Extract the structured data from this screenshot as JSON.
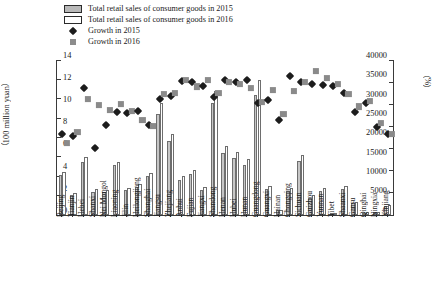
{
  "legend": {
    "items": [
      {
        "key": "bar-filled",
        "label": "Total retail sales of consumer goods in 2015"
      },
      {
        "key": "bar-hollow",
        "label": "Total retail sales of consumer goods in 2016"
      },
      {
        "key": "diamond-black",
        "label": "Growth in 2015"
      },
      {
        "key": "square-gray",
        "label": "Growth in 2016"
      }
    ]
  },
  "axes": {
    "left_title": "（100 million yuan）",
    "right_title": "（%）",
    "left_ticks": [
      "0",
      "5000",
      "10000",
      "15000",
      "20000",
      "25000",
      "30000",
      "35000",
      "40000"
    ],
    "right_ticks": [
      "0",
      "2",
      "4",
      "6",
      "8",
      "10",
      "12",
      "14"
    ]
  },
  "colors": {
    "bar_2015": "#c6c6c6",
    "bar_2016": "#ffffff",
    "bar_edge": "#6e6e6e",
    "growth_2015": "#1c1c1c",
    "growth_2016": "#8a8a8a",
    "axis": "#3a3a3a",
    "background": "#ffffff"
  },
  "chart_data": {
    "type": "bar",
    "title": "",
    "xlabel": "",
    "ylabel": "（100 million yuan）",
    "y2label": "（%）",
    "ylim": [
      0,
      40000
    ],
    "y2lim": [
      0,
      14
    ],
    "grid": false,
    "legend_position": "top-left",
    "categories": [
      "Beijing",
      "Tianjin",
      "Hebei",
      "Shanxi",
      "Nei Mongol",
      "Liaoning",
      "Jilin",
      "Heilongjiang",
      "Shanghai",
      "Jiangsu",
      "Zhejiang",
      "Anhui",
      "Fujian",
      "Jiangxi",
      "Shandong",
      "Henan",
      "Hubei",
      "Hunan",
      "Guangdong",
      "Guangxi",
      "Hainan",
      "Chongqing",
      "Sichuan",
      "Guizhou",
      "Yunnan",
      "Tibet",
      "Shaanxi",
      "Gansu",
      "Qinghai",
      "Ningxia",
      "Xinjiang"
    ],
    "series": [
      {
        "name": "Total retail sales of consumer goods in 2015",
        "axis": "left",
        "unit": "100 million yuan",
        "values": [
          10338,
          5257,
          13610,
          6000,
          5938,
          12875,
          6500,
          7280,
          10000,
          26000,
          19000,
          9000,
          10500,
          6400,
          29000,
          16000,
          14700,
          13000,
          31000,
          6800,
          1200,
          6200,
          14000,
          4500,
          6300,
          400,
          6700,
          3000,
          600,
          800,
          2400
        ]
      },
      {
        "name": "Total retail sales of consumer goods in 2016",
        "axis": "left",
        "unit": "100 million yuan",
        "values": [
          11005,
          5600,
          15000,
          6600,
          6500,
          13700,
          7100,
          7900,
          10900,
          28800,
          21000,
          10000,
          11700,
          7200,
          32000,
          17800,
          16300,
          14400,
          34900,
          7600,
          1400,
          6900,
          15500,
          5100,
          7000,
          450,
          7400,
          3300,
          660,
          900,
          2600
        ]
      },
      {
        "name": "Growth in 2015",
        "axis": "right",
        "unit": "%",
        "values": [
          7.3,
          7.1,
          11.5,
          6.0,
          8.1,
          9.3,
          9.2,
          9.4,
          8.1,
          10.5,
          10.7,
          12.1,
          12.0,
          11.6,
          10.6,
          12.2,
          12.0,
          12.2,
          10.1,
          10.4,
          8.6,
          12.5,
          12.0,
          11.8,
          11.7,
          11.6,
          11.0,
          9.3,
          10.1,
          7.9,
          7.3
        ]
      },
      {
        "name": "Growth in 2016",
        "axis": "right",
        "unit": "%",
        "values": [
          6.5,
          7.5,
          10.5,
          9.9,
          9.5,
          10.0,
          9.4,
          8.6,
          8.0,
          10.9,
          11.0,
          12.2,
          11.6,
          12.2,
          11.0,
          12.0,
          11.8,
          11.5,
          10.2,
          11.3,
          9.1,
          11.2,
          12.0,
          13.0,
          12.4,
          11.8,
          10.9,
          9.8,
          10.3,
          8.3,
          7.3
        ]
      }
    ]
  }
}
